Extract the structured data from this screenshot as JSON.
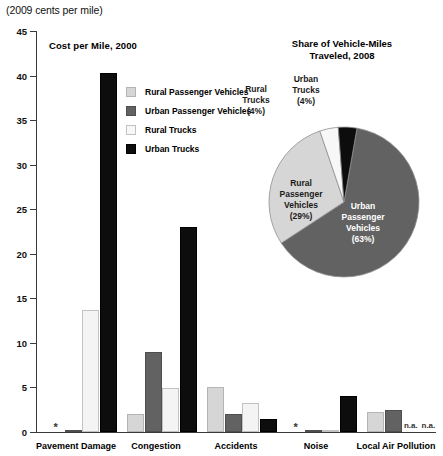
{
  "unit_caption": "(2009 cents per mile)",
  "bar_panel": {
    "title": "Cost per Mile, 2000"
  },
  "pie_panel": {
    "title_line1": "Share of Vehicle-Miles",
    "title_line2": "Traveled, 2008"
  },
  "legend": {
    "items": [
      {
        "label": "Rural Passenger Vehicles",
        "key": "rpv",
        "color": "#d6d6d6"
      },
      {
        "label": "Urban Passenger Vehicles",
        "key": "upv",
        "color": "#626262"
      },
      {
        "label": "Rural Trucks",
        "key": "rt",
        "color": "#f7f7f7"
      },
      {
        "label": "Urban Trucks",
        "key": "ut",
        "color": "#0d0d0d"
      }
    ]
  },
  "axis": {
    "y_ticks": [
      "0",
      "5",
      "10",
      "15",
      "20",
      "25",
      "30",
      "35",
      "40",
      "45"
    ],
    "y_min": 0,
    "y_max": 45
  },
  "markers": {
    "asterisk": "*",
    "na": "n.a."
  },
  "chart_data": [
    {
      "type": "bar",
      "title": "Cost per Mile, 2000",
      "xlabel": "",
      "ylabel": "(2009 cents per mile)",
      "ylim": [
        0,
        45
      ],
      "ytick_step": 5,
      "grid": false,
      "legend_position": "upper-center",
      "categories": [
        "Pavement Damage",
        "Congestion",
        "Accidents",
        "Noise",
        "Local Air Pollution"
      ],
      "series": [
        {
          "name": "Rural Passenger Vehicles",
          "color": "#d6d6d6",
          "values": [
            null,
            2.0,
            5.0,
            null,
            2.2
          ],
          "value_notes": [
            "*",
            "",
            "",
            "*",
            ""
          ]
        },
        {
          "name": "Urban Passenger Vehicles",
          "color": "#626262",
          "values": [
            0.1,
            9.0,
            2.0,
            0.1,
            2.5
          ],
          "value_notes": [
            "",
            "",
            "",
            "",
            ""
          ]
        },
        {
          "name": "Rural Trucks",
          "color": "#f7f7f7",
          "values": [
            13.7,
            4.9,
            3.3,
            0.2,
            null
          ],
          "value_notes": [
            "",
            "",
            "",
            "",
            "n.a."
          ]
        },
        {
          "name": "Urban Trucks",
          "color": "#0d0d0d",
          "values": [
            40.3,
            23.0,
            1.5,
            4.0,
            null
          ],
          "value_notes": [
            "",
            "",
            "",
            "",
            "n.a."
          ]
        }
      ],
      "annotations": [
        "* indicates a value too small to display",
        "n.a. indicates data not available"
      ]
    },
    {
      "type": "pie",
      "title": "Share of Vehicle-Miles Traveled, 2008",
      "labels": [
        "Urban Passenger Vehicles",
        "Rural Passenger Vehicles",
        "Rural Trucks",
        "Urban Trucks"
      ],
      "values": [
        63,
        29,
        4,
        4
      ],
      "value_suffix": "%",
      "colors": [
        "#626262",
        "#d6d6d6",
        "#f7f7f7",
        "#0d0d0d"
      ],
      "slices": [
        {
          "label_line1": "Urban",
          "label_line2": "Passenger",
          "label_line3": "Vehicles",
          "pct": "(63%)",
          "value": 63,
          "color": "#626262",
          "placement": "inside"
        },
        {
          "label_line1": "Rural",
          "label_line2": "Passenger",
          "label_line3": "Vehicles",
          "pct": "(29%)",
          "value": 29,
          "color": "#d6d6d6",
          "placement": "inside"
        },
        {
          "label_line1": "Rural",
          "label_line2": "Trucks",
          "label_line3": "",
          "pct": "(4%)",
          "value": 4,
          "color": "#f7f7f7",
          "placement": "outside"
        },
        {
          "label_line1": "Urban",
          "label_line2": "Trucks",
          "label_line3": "",
          "pct": "(4%)",
          "value": 4,
          "color": "#0d0d0d",
          "placement": "outside"
        }
      ]
    }
  ]
}
